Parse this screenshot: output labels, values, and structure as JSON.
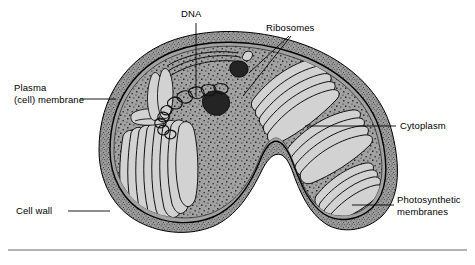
{
  "figure": {
    "background_color": "#ffffff",
    "line_color": "#000000",
    "cytoplasm_color": "#a2a2a2",
    "cell_wall_color": "#9a9a9a",
    "granule_color": "#2a2a2a",
    "lamellae_color": "#cfcfcf"
  },
  "labels": {
    "plasma_membrane": {
      "line1": "Plasma",
      "line2": "(cell) membrane",
      "leader": "horizontal"
    },
    "dna": {
      "text": "DNA",
      "leader": "vertical"
    },
    "ribosomes": {
      "text": "Ribosomes",
      "leader": "double-diagonal"
    },
    "cytoplasm": {
      "text": "Cytoplasm",
      "leader": "horizontal"
    },
    "photosynthetic_membranes": {
      "line1": "Photosynthetic",
      "line2": "membranes",
      "leader": "horizontal"
    },
    "cell_wall": {
      "text": "Cell wall",
      "leader": "horizontal"
    }
  },
  "structures": {
    "granules": "dark inclusion bodies",
    "dna_fibrils": "tangled nucleoid strands",
    "thylakoids": "stacked photosynthetic lamellae",
    "stipple": "ribosome stippling"
  },
  "rule": {
    "name": "bottom-divider"
  }
}
